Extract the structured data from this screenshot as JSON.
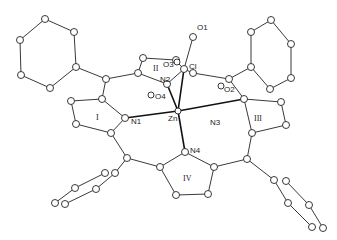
{
  "figure": {
    "type": "ORTEP molecular structure",
    "metal": "Zn",
    "atom_labels": {
      "zn": "Zn",
      "n1": "N1",
      "n2": "N2",
      "n3": "N3",
      "n4": "N4",
      "cl": "Cl",
      "o1": "O1",
      "o2": "O2",
      "o3": "O3",
      "o4": "O4"
    },
    "ring_labels": {
      "r1": "I",
      "r2": "II",
      "r3": "III",
      "r4": "IV"
    }
  }
}
